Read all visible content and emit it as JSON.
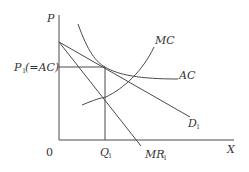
{
  "diagram": {
    "type": "economics-monopolistic-competition-long-run-equilibrium",
    "axes": {
      "y_label": "P",
      "x_label": "X",
      "origin_label": "0"
    },
    "curves": {
      "mc": {
        "label": "MC"
      },
      "ac": {
        "label": "AC"
      },
      "demand": {
        "label": "D",
        "subscript": "1"
      },
      "marginal_revenue": {
        "label": "MR",
        "subscript": "1"
      }
    },
    "equilibrium": {
      "price_label": "P",
      "price_subscript": "1",
      "price_note": "(=AC)",
      "quantity_label": "Q",
      "quantity_subscript": "1"
    },
    "colors": {
      "line": "#4a4a4a",
      "text": "#333333",
      "background": "#ffffff"
    }
  }
}
